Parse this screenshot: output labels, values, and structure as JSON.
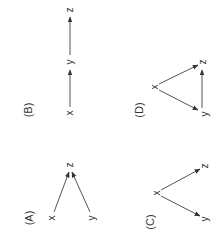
{
  "figure": {
    "orientation": "rotated -90deg",
    "stroke_color": "#555555",
    "text_color": "#333333",
    "panels": [
      {
        "id": "A",
        "label": "(A)",
        "nodes": {
          "x": "x",
          "y": "y",
          "z": "z"
        },
        "edges": [
          [
            "x",
            "z"
          ],
          [
            "y",
            "z"
          ]
        ]
      },
      {
        "id": "B",
        "label": "(B)",
        "nodes": {
          "x": "x",
          "y": "y",
          "z": "z"
        },
        "edges": [
          [
            "x",
            "y"
          ],
          [
            "y",
            "z"
          ]
        ]
      },
      {
        "id": "C",
        "label": "(C)",
        "nodes": {
          "x": "x",
          "y": "y",
          "z": "z"
        },
        "edges": [
          [
            "x",
            "z"
          ],
          [
            "x",
            "y"
          ]
        ]
      },
      {
        "id": "D",
        "label": "(D)",
        "nodes": {
          "x": "x",
          "y": "y",
          "z": "z"
        },
        "edges": [
          [
            "x",
            "z"
          ],
          [
            "x",
            "y"
          ],
          [
            "y",
            "z"
          ]
        ]
      }
    ]
  }
}
